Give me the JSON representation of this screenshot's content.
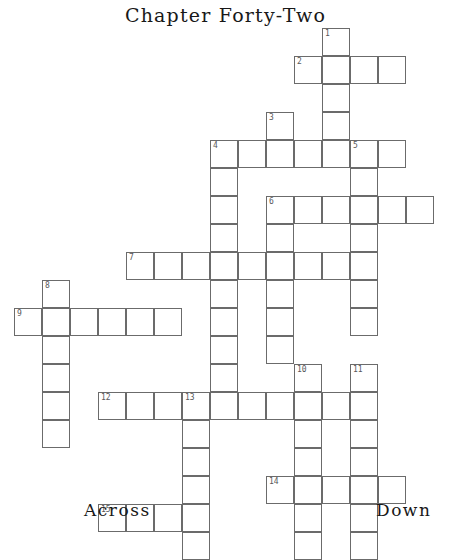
{
  "title": "Chapter Forty-Two",
  "legend": {
    "across_label": "Across",
    "down_label": "Down"
  },
  "grid": {
    "cell_size": 28,
    "origin_x": 14,
    "origin_y": 28,
    "cols": 15,
    "rows": 17,
    "line_color": "#6b6b6b",
    "cell_fill": "#ffffff",
    "number_color": "#58585a",
    "note": "cells listed as [col,row] zero-based from origin; col 0 left edge x=14, row 0 top y=28",
    "cells": [
      {
        "c": 11,
        "r": 0,
        "n": "1"
      },
      {
        "c": 10,
        "r": 1,
        "n": "2"
      },
      {
        "c": 11,
        "r": 1
      },
      {
        "c": 12,
        "r": 1
      },
      {
        "c": 13,
        "r": 1
      },
      {
        "c": 11,
        "r": 2
      },
      {
        "c": 11,
        "r": 3
      },
      {
        "c": 9,
        "r": 3,
        "n": "3"
      },
      {
        "c": 7,
        "r": 4,
        "n": "4"
      },
      {
        "c": 8,
        "r": 4
      },
      {
        "c": 9,
        "r": 4
      },
      {
        "c": 10,
        "r": 4
      },
      {
        "c": 11,
        "r": 4
      },
      {
        "c": 12,
        "r": 4,
        "n": "5"
      },
      {
        "c": 13,
        "r": 4
      },
      {
        "c": 7,
        "r": 5
      },
      {
        "c": 12,
        "r": 5
      },
      {
        "c": 7,
        "r": 6
      },
      {
        "c": 9,
        "r": 6,
        "n": "6"
      },
      {
        "c": 10,
        "r": 6
      },
      {
        "c": 11,
        "r": 6
      },
      {
        "c": 12,
        "r": 6
      },
      {
        "c": 13,
        "r": 6
      },
      {
        "c": 14,
        "r": 6
      },
      {
        "c": 7,
        "r": 7
      },
      {
        "c": 9,
        "r": 7
      },
      {
        "c": 12,
        "r": 7
      },
      {
        "c": 4,
        "r": 8,
        "n": "7"
      },
      {
        "c": 5,
        "r": 8
      },
      {
        "c": 6,
        "r": 8
      },
      {
        "c": 7,
        "r": 8
      },
      {
        "c": 8,
        "r": 8
      },
      {
        "c": 9,
        "r": 8
      },
      {
        "c": 10,
        "r": 8
      },
      {
        "c": 11,
        "r": 8
      },
      {
        "c": 12,
        "r": 8
      },
      {
        "c": 1,
        "r": 9,
        "n": "8"
      },
      {
        "c": 7,
        "r": 9
      },
      {
        "c": 9,
        "r": 9
      },
      {
        "c": 12,
        "r": 9
      },
      {
        "c": 0,
        "r": 10,
        "n": "9"
      },
      {
        "c": 1,
        "r": 10
      },
      {
        "c": 2,
        "r": 10
      },
      {
        "c": 3,
        "r": 10
      },
      {
        "c": 4,
        "r": 10
      },
      {
        "c": 5,
        "r": 10
      },
      {
        "c": 7,
        "r": 10
      },
      {
        "c": 9,
        "r": 10
      },
      {
        "c": 12,
        "r": 10
      },
      {
        "c": 1,
        "r": 11
      },
      {
        "c": 7,
        "r": 11
      },
      {
        "c": 9,
        "r": 11
      },
      {
        "c": 1,
        "r": 12
      },
      {
        "c": 7,
        "r": 12
      },
      {
        "c": 10,
        "r": 12,
        "n": "10"
      },
      {
        "c": 12,
        "r": 12,
        "n": "11"
      },
      {
        "c": 1,
        "r": 13
      },
      {
        "c": 3,
        "r": 13,
        "n": "12"
      },
      {
        "c": 4,
        "r": 13
      },
      {
        "c": 5,
        "r": 13
      },
      {
        "c": 6,
        "r": 13,
        "n": "13"
      },
      {
        "c": 7,
        "r": 13
      },
      {
        "c": 8,
        "r": 13
      },
      {
        "c": 9,
        "r": 13
      },
      {
        "c": 10,
        "r": 13
      },
      {
        "c": 11,
        "r": 13
      },
      {
        "c": 12,
        "r": 13
      },
      {
        "c": 1,
        "r": 14
      },
      {
        "c": 6,
        "r": 14
      },
      {
        "c": 10,
        "r": 14
      },
      {
        "c": 12,
        "r": 14
      },
      {
        "c": 6,
        "r": 15
      },
      {
        "c": 10,
        "r": 15
      },
      {
        "c": 12,
        "r": 15
      },
      {
        "c": 6,
        "r": 16
      },
      {
        "c": 9,
        "r": 16,
        "n": "14"
      },
      {
        "c": 10,
        "r": 16
      },
      {
        "c": 11,
        "r": 16
      },
      {
        "c": 12,
        "r": 16
      },
      {
        "c": 13,
        "r": 16
      },
      {
        "c": 3,
        "r": 17,
        "n": "15"
      },
      {
        "c": 4,
        "r": 17
      },
      {
        "c": 5,
        "r": 17
      },
      {
        "c": 6,
        "r": 17
      },
      {
        "c": 10,
        "r": 17
      },
      {
        "c": 12,
        "r": 17
      },
      {
        "c": 6,
        "r": 18
      },
      {
        "c": 10,
        "r": 18
      },
      {
        "c": 12,
        "r": 18
      }
    ]
  }
}
